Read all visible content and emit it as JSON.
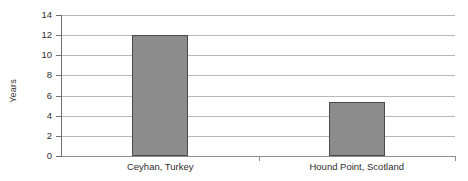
{
  "chart_data": {
    "type": "bar",
    "title": "",
    "xlabel": "",
    "ylabel": "Years",
    "categories": [
      "Ceyhan, Turkey",
      "Hound Point, Scotland"
    ],
    "values": [
      12,
      5.4
    ],
    "ylim": [
      0,
      14
    ],
    "yticks": [
      0,
      2,
      4,
      6,
      8,
      10,
      12,
      14
    ],
    "ytick_labels": [
      "0",
      "2",
      "4",
      "6",
      "8",
      "10",
      "12",
      "14"
    ],
    "grid": true,
    "legend": "none",
    "series": [
      {
        "name": "Years",
        "values": [
          12,
          5.4
        ]
      }
    ],
    "colors": {
      "bar_fill": "#8c8c8c",
      "bar_stroke": "#4a4a4a",
      "gridline": "#b9b9b9",
      "axis": "#6f6f6f",
      "text": "#2e2e2e",
      "background": "#ffffff"
    }
  }
}
